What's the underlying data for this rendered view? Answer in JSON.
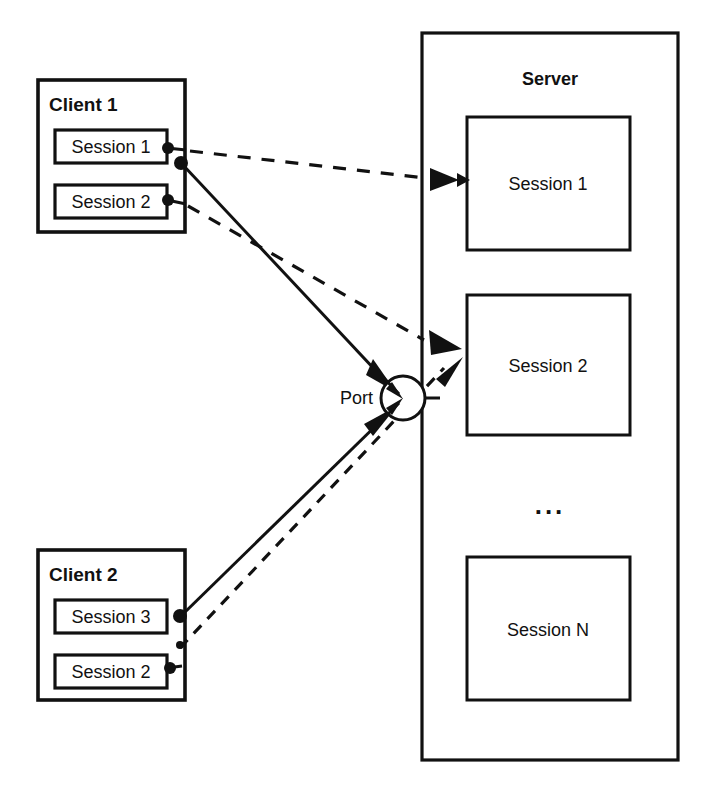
{
  "diagram": {
    "clients": [
      {
        "label": "Client 1",
        "sessions": [
          {
            "label": "Session 1"
          },
          {
            "label": "Session 2"
          }
        ]
      },
      {
        "label": "Client 2",
        "sessions": [
          {
            "label": "Session 3"
          },
          {
            "label": "Session 2"
          }
        ]
      }
    ],
    "server": {
      "label": "Server",
      "sessions": [
        {
          "label": "Session 1"
        },
        {
          "label": "Session 2"
        },
        {
          "label": "Session N"
        }
      ],
      "ellipsis": "..."
    },
    "port": {
      "label": "Port"
    },
    "colors": {
      "line": "#111111",
      "background": "#ffffff",
      "text": "#111111"
    }
  }
}
